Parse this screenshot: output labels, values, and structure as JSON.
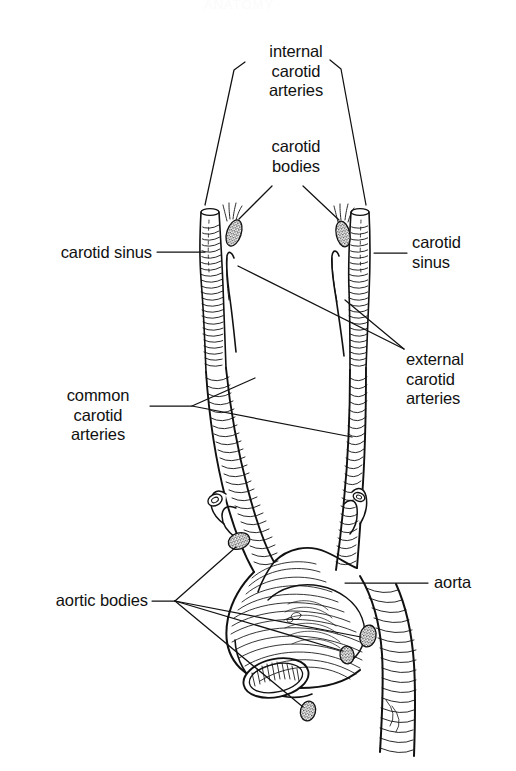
{
  "figure": {
    "title_faint": "ANATOMY",
    "background": "#ffffff",
    "ink": "#111111",
    "width": 516,
    "height": 771
  },
  "labels": {
    "internal_carotid_arteries": "internal\ncarotid\narteries",
    "carotid_bodies": "carotid\nbodies",
    "carotid_sinus_left": "carotid sinus",
    "carotid_sinus_right": "carotid\nsinus",
    "external_carotid_arteries": "external\ncarotid\narteries",
    "common_carotid_arteries": "common\ncarotid\narteries",
    "aortic_bodies": "aortic bodies",
    "aorta": "aorta"
  },
  "structures": [
    {
      "name": "internal-carotid-artery-left",
      "side": "left",
      "kind": "vessel"
    },
    {
      "name": "internal-carotid-artery-right",
      "side": "right",
      "kind": "vessel"
    },
    {
      "name": "external-carotid-artery-left",
      "side": "left",
      "kind": "vessel"
    },
    {
      "name": "external-carotid-artery-right",
      "side": "right",
      "kind": "vessel"
    },
    {
      "name": "common-carotid-artery-left",
      "side": "left",
      "kind": "vessel"
    },
    {
      "name": "common-carotid-artery-right",
      "side": "right",
      "kind": "vessel"
    },
    {
      "name": "carotid-body-left",
      "side": "left",
      "kind": "chemoreceptor"
    },
    {
      "name": "carotid-body-right",
      "side": "right",
      "kind": "chemoreceptor"
    },
    {
      "name": "aortic-arch",
      "side": "center",
      "kind": "vessel"
    },
    {
      "name": "ascending-aorta",
      "side": "center",
      "kind": "vessel"
    },
    {
      "name": "descending-aorta",
      "side": "center",
      "kind": "vessel"
    },
    {
      "name": "subclavian-artery-left",
      "side": "left",
      "kind": "vessel"
    },
    {
      "name": "subclavian-artery-right",
      "side": "right",
      "kind": "vessel"
    },
    {
      "name": "pulmonary-trunk-stump",
      "side": "center",
      "kind": "vessel"
    },
    {
      "name": "aortic-body-1",
      "side": "left",
      "kind": "chemoreceptor"
    },
    {
      "name": "aortic-body-2",
      "side": "right",
      "kind": "chemoreceptor"
    },
    {
      "name": "aortic-body-3",
      "side": "center",
      "kind": "chemoreceptor"
    },
    {
      "name": "aortic-body-4",
      "side": "center",
      "kind": "chemoreceptor"
    }
  ],
  "leaders": {
    "internal_carotid_arteries": 2,
    "carotid_bodies": 2,
    "carotid_sinus_left": 1,
    "carotid_sinus_right": 1,
    "external_carotid_arteries": 2,
    "common_carotid_arteries": 2,
    "aortic_bodies": 4,
    "aorta": 1
  }
}
